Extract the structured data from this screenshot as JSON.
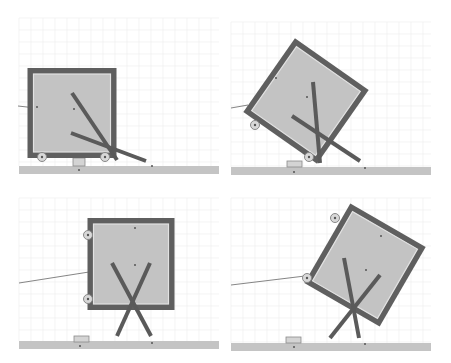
{
  "figure": {
    "width": 451,
    "height": 363
  },
  "colors": {
    "background": "#ffffff",
    "grid": "#ececec",
    "ground": "#c4c4c4",
    "box_frame": "#5f5f5f",
    "box_fill": "#c3c3c3",
    "rod": "#5a5a5a",
    "wheel": "#d8d8d8"
  },
  "panels": [
    {
      "id": "top-left",
      "grid": {
        "x0": 19,
        "y0": 18,
        "x1": 219,
        "y1": 166,
        "step": 12
      },
      "ground": {
        "x": 19,
        "y": 166,
        "w": 200,
        "h": 8
      },
      "block": {
        "x": 73,
        "y": 158,
        "w": 12,
        "h": 8
      },
      "ground_dots": [
        [
          79,
          170
        ],
        [
          152,
          166
        ]
      ],
      "box": {
        "cx": 72,
        "cy": 113,
        "w": 89,
        "h": 90,
        "angle": 0,
        "frame": 6
      },
      "wheels": [
        [
          42,
          157
        ],
        [
          105,
          157
        ]
      ],
      "string": [
        [
          18,
          106
        ],
        [
          36,
          108
        ]
      ],
      "rods": [
        [
          [
            72,
            93
          ],
          [
            117,
            160
          ]
        ],
        [
          [
            71,
            133
          ],
          [
            146,
            161
          ]
        ]
      ],
      "dots": [
        [
          74,
          109
        ],
        [
          37,
          107
        ]
      ]
    },
    {
      "id": "top-right",
      "grid": {
        "x0": 231,
        "y0": 22,
        "x1": 431,
        "y1": 167,
        "step": 12
      },
      "ground": {
        "x": 231,
        "y": 167,
        "w": 200,
        "h": 8
      },
      "block": {
        "x": 287,
        "y": 161,
        "w": 15,
        "h": 6
      },
      "ground_dots": [
        [
          294,
          172
        ],
        [
          365,
          168
        ]
      ],
      "box": {
        "cx": 306,
        "cy": 101,
        "w": 90,
        "h": 90,
        "angle": 35,
        "frame": 6
      },
      "wheels": [
        [
          255,
          125
        ],
        [
          309,
          157
        ]
      ],
      "string": [
        [
          231,
          108
        ],
        [
          248,
          105
        ]
      ],
      "rods": [
        [
          [
            313,
            82
          ],
          [
            320,
            163
          ]
        ],
        [
          [
            292,
            116
          ],
          [
            360,
            161
          ]
        ]
      ],
      "dots": [
        [
          307,
          97
        ],
        [
          276,
          78
        ]
      ]
    },
    {
      "id": "bottom-left",
      "grid": {
        "x0": 19,
        "y0": 198,
        "x1": 219,
        "y1": 341,
        "step": 12
      },
      "ground": {
        "x": 19,
        "y": 341,
        "w": 200,
        "h": 8
      },
      "block": {
        "x": 74,
        "y": 336,
        "w": 15,
        "h": 6
      },
      "ground_dots": [
        [
          80,
          346
        ],
        [
          152,
          343
        ]
      ],
      "box": {
        "cx": 131,
        "cy": 264,
        "w": 87,
        "h": 92,
        "angle": 0,
        "frame": 6
      },
      "wheels": [
        [
          88,
          235
        ],
        [
          88,
          299
        ]
      ],
      "string": [
        [
          19,
          283
        ],
        [
          89,
          272
        ]
      ],
      "rods": [
        [
          [
            112,
            263
          ],
          [
            151,
            336
          ]
        ],
        [
          [
            150,
            263
          ],
          [
            117,
            336
          ]
        ]
      ],
      "dots": [
        [
          135,
          265
        ],
        [
          135,
          228
        ]
      ]
    },
    {
      "id": "bottom-right",
      "grid": {
        "x0": 231,
        "y0": 198,
        "x1": 431,
        "y1": 343,
        "step": 12
      },
      "ground": {
        "x": 231,
        "y": 343,
        "w": 200,
        "h": 8
      },
      "block": {
        "x": 286,
        "y": 337,
        "w": 15,
        "h": 6
      },
      "ground_dots": [
        [
          294,
          347
        ],
        [
          365,
          344
        ]
      ],
      "box": {
        "cx": 365,
        "cy": 265,
        "w": 87,
        "h": 92,
        "angle": 30,
        "frame": 6
      },
      "wheels": [
        [
          335,
          218
        ],
        [
          307,
          278
        ]
      ],
      "string": [
        [
          231,
          285
        ],
        [
          305,
          276
        ]
      ],
      "rods": [
        [
          [
            344,
            258
          ],
          [
            359,
            338
          ]
        ],
        [
          [
            380,
            275
          ],
          [
            330,
            338
          ]
        ]
      ],
      "dots": [
        [
          366,
          270
        ],
        [
          381,
          236
        ]
      ]
    }
  ]
}
